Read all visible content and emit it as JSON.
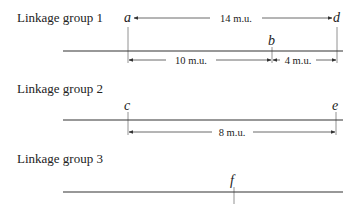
{
  "groups": [
    {
      "label": "Linkage group 1",
      "markers": [
        {
          "name": "a",
          "x": 128
        },
        {
          "name": "b",
          "x": 272
        },
        {
          "name": "d",
          "x": 337
        }
      ],
      "distances": [
        {
          "from": "a",
          "to": "d",
          "label": "14 m.u."
        },
        {
          "from": "a",
          "to": "b",
          "label": "10 m.u."
        },
        {
          "from": "b",
          "to": "d",
          "label": "4 m.u."
        }
      ]
    },
    {
      "label": "Linkage group 2",
      "markers": [
        {
          "name": "c",
          "x": 128
        },
        {
          "name": "e",
          "x": 336
        }
      ],
      "distances": [
        {
          "from": "c",
          "to": "e",
          "label": "8 m.u."
        }
      ]
    },
    {
      "label": "Linkage group 3",
      "markers": [
        {
          "name": "f",
          "x": 234
        }
      ],
      "distances": []
    }
  ]
}
